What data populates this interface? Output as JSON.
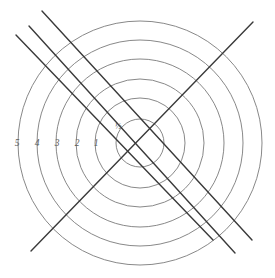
{
  "figure": {
    "background_color": "#ffffff",
    "width": 275,
    "height": 278
  },
  "chart_data": {
    "type": "line",
    "title": "",
    "subtitle": "",
    "xlabel": "",
    "ylabel": "",
    "grid": false,
    "legend_position": "none",
    "center": {
      "x": 140,
      "y": 143
    },
    "contour_color": "#7b7b7b",
    "line_color": "#3a3a3a",
    "label_color": "#5a5a5a",
    "contours": [
      {
        "label": "½",
        "value": 0.5,
        "radius": 24,
        "label_x": 118,
        "label_y": 127
      },
      {
        "label": "1",
        "value": 1,
        "radius": 45,
        "label_x": 96,
        "label_y": 144
      },
      {
        "label": "2",
        "value": 2,
        "radius": 64,
        "label_x": 77,
        "label_y": 144
      },
      {
        "label": "3",
        "value": 3,
        "radius": 84,
        "label_x": 57,
        "label_y": 144
      },
      {
        "label": "4",
        "value": 4,
        "radius": 103,
        "label_x": 37,
        "label_y": 144
      },
      {
        "label": "5",
        "value": 5,
        "radius": 122,
        "label_x": 17,
        "label_y": 144
      }
    ],
    "lines": [
      {
        "name": "descending-line-1",
        "x1": 16,
        "y1": 35,
        "x2": 213,
        "y2": 240
      },
      {
        "name": "descending-line-2",
        "x1": 29,
        "y1": 26,
        "x2": 235,
        "y2": 253
      },
      {
        "name": "descending-line-3",
        "x1": 42,
        "y1": 11,
        "x2": 252,
        "y2": 240
      },
      {
        "name": "ascending-line-1",
        "x1": 31,
        "y1": 251,
        "x2": 253,
        "y2": 22
      }
    ],
    "tick_labels": [
      "½",
      "1",
      "2",
      "3",
      "4",
      "5"
    ],
    "values": [
      0.5,
      1,
      2,
      3,
      4,
      5
    ]
  }
}
